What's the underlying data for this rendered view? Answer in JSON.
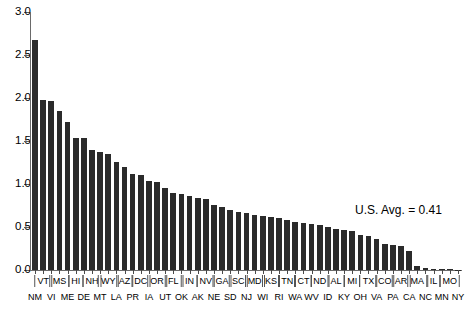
{
  "chart_data": {
    "type": "bar",
    "title": "",
    "xlabel": "",
    "ylabel": "",
    "ylim": [
      0.0,
      3.0
    ],
    "ytick_labels": [
      "0.0",
      "0.5",
      "1.0",
      "1.5",
      "2.0",
      "2.5",
      "3.0"
    ],
    "ytick_values": [
      0.0,
      0.5,
      1.0,
      1.5,
      2.0,
      2.5,
      3.0
    ],
    "grid": false,
    "legend": "none",
    "annotation": "U.S. Avg. = 0.41",
    "annotation_value": 0.41,
    "bar_color": "#2b2b2b",
    "axis_color": "#6a6a6a",
    "label_rows": 2,
    "categories": [
      "NM",
      "VT",
      "VI",
      "MS",
      "ME",
      "HI",
      "DE",
      "NH",
      "MT",
      "WY",
      "LA",
      "AZ",
      "PR",
      "DC",
      "IA",
      "OR",
      "UT",
      "FL",
      "OK",
      "IN",
      "AK",
      "NV",
      "NE",
      "GA",
      "SD",
      "SC",
      "NJ",
      "MD",
      "WI",
      "KS",
      "RI",
      "TN",
      "WA",
      "CT",
      "WV",
      "ND",
      "ID",
      "AL",
      "KY",
      "MI",
      "OH",
      "TX",
      "VA",
      "CO",
      "PA",
      "AR",
      "CA",
      "MA",
      "NC",
      "IL",
      "MN",
      "MO",
      "NY"
    ],
    "values": [
      2.67,
      1.98,
      1.96,
      1.85,
      1.72,
      1.54,
      1.53,
      1.39,
      1.37,
      1.35,
      1.26,
      1.2,
      1.12,
      1.11,
      1.04,
      1.02,
      0.95,
      0.9,
      0.88,
      0.86,
      0.84,
      0.82,
      0.76,
      0.73,
      0.7,
      0.68,
      0.66,
      0.64,
      0.63,
      0.62,
      0.6,
      0.58,
      0.56,
      0.55,
      0.53,
      0.52,
      0.5,
      0.48,
      0.47,
      0.45,
      0.41,
      0.4,
      0.36,
      0.3,
      0.29,
      0.28,
      0.22,
      0.05,
      0.02,
      0.01,
      0.01,
      0.01,
      0.0
    ]
  },
  "x_labels": {
    "top_row": [
      "VT",
      "MS",
      "HI",
      "NH",
      "WY",
      "AZ",
      "DC",
      "OR",
      "FL",
      "IN",
      "NV",
      "GA",
      "SC",
      "MD",
      "KS",
      "TN",
      "CT",
      "ND",
      "AL",
      "MI",
      "TX",
      "CO",
      "AR",
      "MA",
      "IL",
      "MO"
    ],
    "bottom_row": [
      "NM",
      "VI",
      "ME",
      "DE",
      "MT",
      "LA",
      "PR",
      "IA",
      "UT",
      "OK",
      "AK",
      "NE",
      "SD",
      "NJ",
      "WI",
      "RI",
      "WA",
      "WV",
      "ID",
      "KY",
      "OH",
      "VA",
      "PA",
      "CA",
      "NC",
      "MN",
      "NY"
    ]
  }
}
